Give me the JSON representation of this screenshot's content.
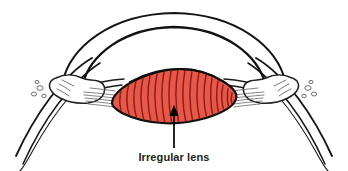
{
  "figure": {
    "name": "irregular-lens-eye-diagram",
    "type": "anatomical-illustration",
    "background_color": "#ffffff",
    "width": 348,
    "height": 171
  },
  "label": {
    "text": "Irregular lens",
    "color": "#231f20",
    "font_size_px": 11,
    "x": 174,
    "y": 160
  },
  "pointer": {
    "name": "arrow",
    "description": "vertical arrow pointing up from the caption into the lens body",
    "color": "#000000",
    "x": 174,
    "y_tail": 148,
    "y_head": 106
  },
  "parts": [
    {
      "name": "cornea-outer-arc",
      "label": "Cornea (outer surface)",
      "stroke": "#141414",
      "fill": "none"
    },
    {
      "name": "cornea-inner-arc",
      "label": "Cornea (inner surface)",
      "stroke": "#141414",
      "fill": "none"
    },
    {
      "name": "lens",
      "label": "Irregular lens",
      "fill": "#e8584a",
      "stroke": "#111111",
      "striation_color": "#8f1f14"
    },
    {
      "name": "ciliary-body-left",
      "label": "Ciliary body (left)",
      "stroke": "#2a2a2a",
      "fill": "#ffffff"
    },
    {
      "name": "ciliary-body-right",
      "label": "Ciliary body (right)",
      "stroke": "#2a2a2a",
      "fill": "#ffffff"
    },
    {
      "name": "sclera-left",
      "label": "Sclera (left)",
      "stroke": "#1a1a1a",
      "fill": "none"
    },
    {
      "name": "sclera-right",
      "label": "Sclera (right)",
      "stroke": "#1a1a1a",
      "fill": "none"
    },
    {
      "name": "zonule-fibers-left",
      "label": "Suspensory zonule fibers (left)",
      "stroke": "#555555"
    },
    {
      "name": "zonule-fibers-right",
      "label": "Suspensory zonule fibers (right)",
      "stroke": "#555555"
    }
  ],
  "colors": {
    "lens_fill": "#e8584a",
    "lens_stroke": "#111111",
    "lens_striation": "#8f1f14",
    "ink": "#141414",
    "hatch": "#6a6a6a",
    "text": "#231f20",
    "background": "#ffffff"
  }
}
